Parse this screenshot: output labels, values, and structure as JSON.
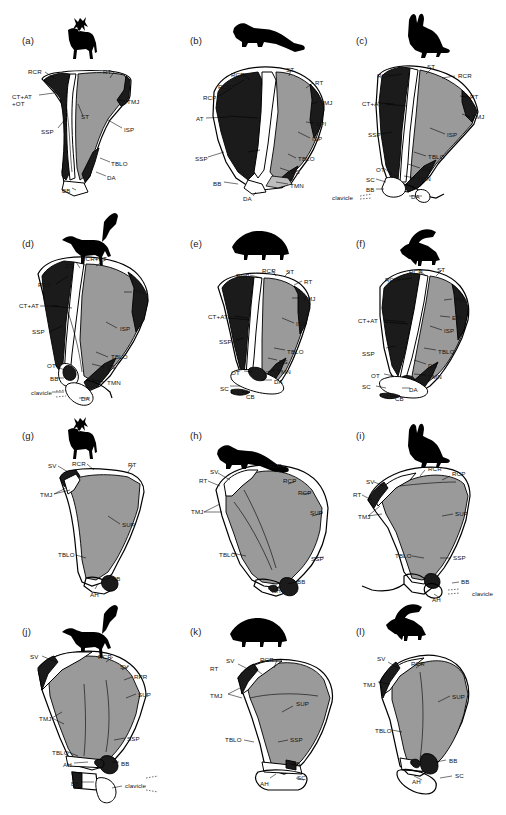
{
  "figure": {
    "view_rows": [
      "lateral view (a-f)",
      "medial view (g-l)"
    ],
    "width": 506,
    "height": 815,
    "colors": {
      "background": "#ffffff",
      "outline": "#000000",
      "dark_fill": "#1b1b1b",
      "gray_fill": "#9a9a9a",
      "light_gray_fill": "#bdbdbd",
      "white_fill": "#ffffff",
      "label_text": "#111111"
    },
    "abbreviations": [
      "RCR",
      "RCP",
      "RT",
      "ST",
      "TMJ",
      "ISP",
      "SSP",
      "SUP",
      "TBLO",
      "DS",
      "DA",
      "TMN",
      "BB",
      "AT",
      "CT+AT",
      "+OT",
      "OT",
      "EPI",
      "SC",
      "CB",
      "SV",
      "RPR",
      "AH",
      "clavicle"
    ]
  },
  "panels": [
    {
      "id": "a",
      "panel_label": "(a)",
      "animal": "deer",
      "silhouette": "deer-silhouette",
      "view": "lateral",
      "labels": [
        {
          "text": "RCR",
          "x": 28,
          "y": 68
        },
        {
          "text": "RT",
          "x": 103,
          "y": 68
        },
        {
          "text": "CT+AT",
          "x": 12,
          "y": 93
        },
        {
          "text": "+OT",
          "x": 12,
          "y": 100
        },
        {
          "text": "TMJ",
          "x": 127,
          "y": 98
        },
        {
          "text": "ST",
          "x": 81,
          "y": 113
        },
        {
          "text": "ISP",
          "x": 124,
          "y": 126
        },
        {
          "text": "SSP",
          "x": 41,
          "y": 128
        },
        {
          "text": "TBLO",
          "x": 111,
          "y": 160
        },
        {
          "text": "DA",
          "x": 107,
          "y": 174
        },
        {
          "text": "BB",
          "x": 62,
          "y": 187
        }
      ]
    },
    {
      "id": "b",
      "panel_label": "(b)",
      "animal": "marten",
      "silhouette": "marten-silhouette",
      "view": "lateral",
      "labels": [
        {
          "text": "RCR",
          "x": 231,
          "y": 71
        },
        {
          "text": "ST",
          "x": 286,
          "y": 66
        },
        {
          "text": "RCP",
          "x": 218,
          "y": 83
        },
        {
          "text": "RT",
          "x": 315,
          "y": 79
        },
        {
          "text": "RCP",
          "x": 203,
          "y": 94
        },
        {
          "text": "TMJ",
          "x": 320,
          "y": 99
        },
        {
          "text": "AT",
          "x": 196,
          "y": 115
        },
        {
          "text": "EPI",
          "x": 316,
          "y": 120
        },
        {
          "text": "ISP",
          "x": 312,
          "y": 135
        },
        {
          "text": "SSP",
          "x": 195,
          "y": 155
        },
        {
          "text": "TBLO",
          "x": 298,
          "y": 155
        },
        {
          "text": "DS",
          "x": 291,
          "y": 168
        },
        {
          "text": "BB",
          "x": 213,
          "y": 180
        },
        {
          "text": "TMN",
          "x": 290,
          "y": 182
        },
        {
          "text": "DA",
          "x": 243,
          "y": 195
        }
      ]
    },
    {
      "id": "c",
      "panel_label": "(c)",
      "animal": "rabbit",
      "silhouette": "rabbit-silhouette",
      "view": "lateral",
      "labels": [
        {
          "text": "ST",
          "x": 427,
          "y": 63
        },
        {
          "text": "RCP",
          "x": 377,
          "y": 72
        },
        {
          "text": "RCR",
          "x": 458,
          "y": 72
        },
        {
          "text": "RT",
          "x": 470,
          "y": 93
        },
        {
          "text": "CT+AT",
          "x": 362,
          "y": 100
        },
        {
          "text": "TMJ",
          "x": 472,
          "y": 113
        },
        {
          "text": "SSP",
          "x": 368,
          "y": 131
        },
        {
          "text": "ISP",
          "x": 447,
          "y": 131
        },
        {
          "text": "TBLO",
          "x": 428,
          "y": 153
        },
        {
          "text": "DS",
          "x": 422,
          "y": 165
        },
        {
          "text": "OT",
          "x": 376,
          "y": 166
        },
        {
          "text": "TMN",
          "x": 417,
          "y": 175
        },
        {
          "text": "SC",
          "x": 366,
          "y": 176
        },
        {
          "text": "BB",
          "x": 366,
          "y": 186
        },
        {
          "text": "clavicle",
          "x": 332,
          "y": 194
        },
        {
          "text": "DA",
          "x": 411,
          "y": 193
        }
      ]
    },
    {
      "id": "d",
      "panel_label": "(d)",
      "animal": "cat",
      "silhouette": "cat-silhouette",
      "view": "lateral",
      "labels": [
        {
          "text": "ST",
          "x": 65,
          "y": 262
        },
        {
          "text": "RCR+RT",
          "x": 81,
          "y": 255
        },
        {
          "text": "RCP",
          "x": 38,
          "y": 281
        },
        {
          "text": "TMJ",
          "x": 135,
          "y": 288
        },
        {
          "text": "CT+AT",
          "x": 19,
          "y": 302
        },
        {
          "text": "SSP",
          "x": 32,
          "y": 328
        },
        {
          "text": "ISP",
          "x": 120,
          "y": 325
        },
        {
          "text": "TBLO",
          "x": 111,
          "y": 353
        },
        {
          "text": "OT",
          "x": 47,
          "y": 362
        },
        {
          "text": "DS",
          "x": 107,
          "y": 363
        },
        {
          "text": "BB",
          "x": 50,
          "y": 375
        },
        {
          "text": "TMN",
          "x": 107,
          "y": 379
        },
        {
          "text": "clavicle",
          "x": 31,
          "y": 389
        },
        {
          "text": "DA",
          "x": 81,
          "y": 395
        }
      ]
    },
    {
      "id": "e",
      "panel_label": "(e)",
      "animal": "hedgehog",
      "silhouette": "hedgehog-silhouette",
      "view": "lateral",
      "labels": [
        {
          "text": "RCR",
          "x": 262,
          "y": 267
        },
        {
          "text": "ST",
          "x": 286,
          "y": 268
        },
        {
          "text": "RCP",
          "x": 236,
          "y": 272
        },
        {
          "text": "RT",
          "x": 304,
          "y": 278
        },
        {
          "text": "TMJ",
          "x": 303,
          "y": 295
        },
        {
          "text": "CT+AT",
          "x": 208,
          "y": 313
        },
        {
          "text": "ISP",
          "x": 296,
          "y": 320
        },
        {
          "text": "SSP",
          "x": 219,
          "y": 338
        },
        {
          "text": "TBLO",
          "x": 287,
          "y": 348
        },
        {
          "text": "DS",
          "x": 279,
          "y": 358
        },
        {
          "text": "OT",
          "x": 231,
          "y": 369
        },
        {
          "text": "TMN",
          "x": 277,
          "y": 368
        },
        {
          "text": "DA",
          "x": 274,
          "y": 378
        },
        {
          "text": "SC",
          "x": 220,
          "y": 385
        },
        {
          "text": "CB",
          "x": 246,
          "y": 393
        }
      ]
    },
    {
      "id": "f",
      "panel_label": "(f)",
      "animal": "squirrel",
      "silhouette": "squirrel-silhouette",
      "view": "lateral",
      "labels": [
        {
          "text": "RCR",
          "x": 409,
          "y": 268
        },
        {
          "text": "ST",
          "x": 437,
          "y": 266
        },
        {
          "text": "RCP",
          "x": 385,
          "y": 276
        },
        {
          "text": "TMJ",
          "x": 455,
          "y": 296
        },
        {
          "text": "EPI",
          "x": 452,
          "y": 314
        },
        {
          "text": "CT+AT",
          "x": 358,
          "y": 317
        },
        {
          "text": "ISP",
          "x": 444,
          "y": 327
        },
        {
          "text": "SSP",
          "x": 362,
          "y": 350
        },
        {
          "text": "TBLO",
          "x": 438,
          "y": 348
        },
        {
          "text": "DS",
          "x": 428,
          "y": 362
        },
        {
          "text": "OT",
          "x": 371,
          "y": 372
        },
        {
          "text": "TMN",
          "x": 428,
          "y": 373
        },
        {
          "text": "SC",
          "x": 362,
          "y": 383
        },
        {
          "text": "DA",
          "x": 409,
          "y": 386
        },
        {
          "text": "CB",
          "x": 395,
          "y": 395
        }
      ]
    },
    {
      "id": "g",
      "panel_label": "(g)",
      "animal": "deer",
      "silhouette": "deer-silhouette",
      "view": "medial",
      "labels": [
        {
          "text": "SV",
          "x": 48,
          "y": 462
        },
        {
          "text": "RCR",
          "x": 72,
          "y": 460
        },
        {
          "text": "RT",
          "x": 128,
          "y": 461
        },
        {
          "text": "TMJ",
          "x": 40,
          "y": 491
        },
        {
          "text": "SUP",
          "x": 122,
          "y": 521
        },
        {
          "text": "TBLO",
          "x": 58,
          "y": 551
        },
        {
          "text": "BB",
          "x": 112,
          "y": 575
        },
        {
          "text": "AH",
          "x": 90,
          "y": 591
        }
      ]
    },
    {
      "id": "h",
      "panel_label": "(h)",
      "animal": "marten",
      "silhouette": "marten-silhouette",
      "view": "medial",
      "labels": [
        {
          "text": "RCR",
          "x": 268,
          "y": 462
        },
        {
          "text": "SV",
          "x": 210,
          "y": 468
        },
        {
          "text": "RT",
          "x": 199,
          "y": 477
        },
        {
          "text": "RCP",
          "x": 283,
          "y": 477
        },
        {
          "text": "RCP",
          "x": 298,
          "y": 489
        },
        {
          "text": "TMJ",
          "x": 191,
          "y": 508
        },
        {
          "text": "SUP",
          "x": 310,
          "y": 509
        },
        {
          "text": "TBLO",
          "x": 219,
          "y": 551
        },
        {
          "text": "SSP",
          "x": 311,
          "y": 555
        },
        {
          "text": "BB",
          "x": 297,
          "y": 578
        },
        {
          "text": "AH",
          "x": 272,
          "y": 587
        }
      ]
    },
    {
      "id": "i",
      "panel_label": "(i)",
      "animal": "rabbit",
      "silhouette": "rabbit-silhouette",
      "view": "medial",
      "labels": [
        {
          "text": "RCR",
          "x": 428,
          "y": 465
        },
        {
          "text": "RCP",
          "x": 452,
          "y": 470
        },
        {
          "text": "SV",
          "x": 366,
          "y": 478
        },
        {
          "text": "RT",
          "x": 353,
          "y": 491
        },
        {
          "text": "TMJ",
          "x": 358,
          "y": 513
        },
        {
          "text": "SUP",
          "x": 455,
          "y": 510
        },
        {
          "text": "TBLO",
          "x": 395,
          "y": 552
        },
        {
          "text": "SSP",
          "x": 453,
          "y": 554
        },
        {
          "text": "BB",
          "x": 461,
          "y": 578
        },
        {
          "text": "clavicle",
          "x": 472,
          "y": 590
        },
        {
          "text": "AH",
          "x": 432,
          "y": 596
        }
      ]
    },
    {
      "id": "j",
      "panel_label": "(j)",
      "animal": "cat",
      "silhouette": "cat-silhouette",
      "view": "medial",
      "labels": [
        {
          "text": "SV",
          "x": 30,
          "y": 653
        },
        {
          "text": "RCR",
          "x": 98,
          "y": 653
        },
        {
          "text": "SV",
          "x": 120,
          "y": 663
        },
        {
          "text": "RPR",
          "x": 134,
          "y": 673
        },
        {
          "text": "SUP",
          "x": 138,
          "y": 691
        },
        {
          "text": "TMJ",
          "x": 39,
          "y": 715
        },
        {
          "text": "SSP",
          "x": 127,
          "y": 735
        },
        {
          "text": "TBLO",
          "x": 52,
          "y": 749
        },
        {
          "text": "BB",
          "x": 121,
          "y": 760
        },
        {
          "text": "AH",
          "x": 63,
          "y": 761
        },
        {
          "text": "BB",
          "x": 71,
          "y": 780
        },
        {
          "text": "clavicle",
          "x": 125,
          "y": 782
        }
      ]
    },
    {
      "id": "k",
      "panel_label": "(k)",
      "animal": "hedgehog",
      "silhouette": "hedgehog-silhouette",
      "view": "medial",
      "labels": [
        {
          "text": "SV",
          "x": 226,
          "y": 657
        },
        {
          "text": "RCR",
          "x": 260,
          "y": 656
        },
        {
          "text": "RT",
          "x": 210,
          "y": 665
        },
        {
          "text": "TMJ",
          "x": 210,
          "y": 692
        },
        {
          "text": "SUP",
          "x": 296,
          "y": 700
        },
        {
          "text": "TBLO",
          "x": 225,
          "y": 736
        },
        {
          "text": "SSP",
          "x": 290,
          "y": 736
        },
        {
          "text": "BB",
          "x": 292,
          "y": 760
        },
        {
          "text": "SC",
          "x": 297,
          "y": 774
        },
        {
          "text": "AH",
          "x": 260,
          "y": 780
        }
      ]
    },
    {
      "id": "l",
      "panel_label": "(l)",
      "animal": "squirrel",
      "silhouette": "squirrel-silhouette",
      "view": "medial",
      "labels": [
        {
          "text": "SV",
          "x": 377,
          "y": 655
        },
        {
          "text": "RCR",
          "x": 411,
          "y": 660
        },
        {
          "text": "TMJ",
          "x": 363,
          "y": 681
        },
        {
          "text": "SUP",
          "x": 452,
          "y": 693
        },
        {
          "text": "TBLO",
          "x": 375,
          "y": 727
        },
        {
          "text": "BB",
          "x": 449,
          "y": 757
        },
        {
          "text": "SC",
          "x": 455,
          "y": 772
        },
        {
          "text": "AH",
          "x": 412,
          "y": 778
        }
      ]
    }
  ]
}
